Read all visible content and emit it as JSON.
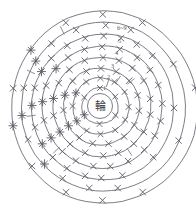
{
  "chart_data": {
    "type": "diagram",
    "title": "",
    "subtitle": "",
    "xlabel": "",
    "ylabel": "",
    "legend_position": "none",
    "grid": false,
    "center_label": "輪",
    "round_labels": [
      "1",
      "2",
      "3",
      "4",
      "5",
      "6~9"
    ],
    "stitch_symbols": {
      "x_mark": "X",
      "plus_mark": "+"
    },
    "rounds": [
      {
        "label": "1",
        "radius": 18,
        "x_count": 6,
        "plus_count": 0
      },
      {
        "label": "2",
        "radius": 28,
        "x_count": 10,
        "plus_count": 2
      },
      {
        "label": "3",
        "radius": 38,
        "x_count": 12,
        "plus_count": 3
      },
      {
        "label": "4",
        "radius": 49,
        "x_count": 14,
        "plus_count": 4
      },
      {
        "label": "5",
        "radius": 60,
        "x_count": 16,
        "plus_count": 5
      },
      {
        "label": "6~9",
        "radius": 71,
        "x_count": 18,
        "plus_count": 6
      },
      {
        "label": "",
        "radius": 82,
        "x_count": 14,
        "plus_count": 5
      },
      {
        "label": "",
        "radius": 93,
        "x_count": 10,
        "plus_count": 4
      }
    ]
  },
  "colors": {
    "background": "#ffffff",
    "stroke": "#6e6e78",
    "symbol": "#5c5c66",
    "label": "#53535c",
    "center_text": "#3a3a42"
  }
}
